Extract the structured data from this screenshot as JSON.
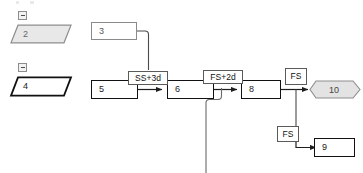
{
  "diagram": {
    "background": "#ffffff",
    "bold_border_color": "#111111",
    "thin_border_color": "#8a8a8a",
    "connector_color": "#3c3c3c",
    "summary_fill": "#e8e8e8",
    "milestone_fill": "#e3e3e3"
  },
  "nodes": {
    "summary_2": {
      "label": "2",
      "shape": "parallelogram",
      "style": "light"
    },
    "summary_4": {
      "label": "4",
      "shape": "parallelogram",
      "style": "bold"
    },
    "task_3": {
      "label": "3",
      "shape": "rectangle",
      "style": "thin"
    },
    "task_5": {
      "label": "5",
      "shape": "rectangle",
      "style": "bold"
    },
    "task_6": {
      "label": "6",
      "shape": "rectangle",
      "style": "bold"
    },
    "task_8": {
      "label": "8",
      "shape": "rectangle",
      "style": "bold"
    },
    "task_9": {
      "label": "9",
      "shape": "rectangle",
      "style": "bold"
    },
    "milestone_10": {
      "label": "10",
      "shape": "hexagon",
      "style": "light"
    }
  },
  "relationships": {
    "ss_3d": {
      "label": "SS+3d"
    },
    "fs_2d": {
      "label": "FS+2d"
    },
    "fs_upper": {
      "label": "FS"
    },
    "fs_lower": {
      "label": "FS"
    }
  },
  "toggles": {
    "toggle_2": {
      "state": "expanded",
      "glyph": "minus"
    },
    "toggle_4": {
      "state": "expanded",
      "glyph": "minus"
    }
  }
}
